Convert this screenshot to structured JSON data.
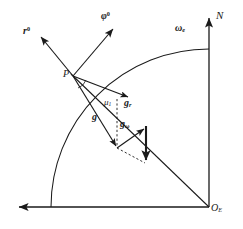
{
  "figure": {
    "name": "earth-gravity-vector-diagram",
    "background": "#ffffff",
    "stroke_color": "#1a1a1a",
    "width": 243,
    "height": 229
  },
  "labels": {
    "r_unit": {
      "base": "r",
      "sup": "0"
    },
    "phi_unit": {
      "base": "φ",
      "sup": "0"
    },
    "omega_e": {
      "base": "ω",
      "sub": "e"
    },
    "north": {
      "base": "N"
    },
    "point_p": {
      "base": "P"
    },
    "origin_e": {
      "base": "O",
      "sub": "E"
    },
    "mu_1": {
      "base": "μ",
      "sub": "1"
    },
    "g_total": {
      "base": "g"
    },
    "g_radial": {
      "base": "g",
      "sub": "r"
    },
    "g_omega": {
      "base": "g",
      "sub": "ω"
    }
  },
  "geometry": {
    "earth_center": {
      "x": 209,
      "y": 207
    },
    "earth_radius": 158,
    "point_p": {
      "x": 73,
      "y": 76
    },
    "axis_vertical": {
      "x": 209,
      "y_top": 14,
      "y_bottom": 207
    },
    "axis_horizontal": {
      "y": 207,
      "x_left": 14,
      "x_right": 209
    },
    "vectors": [
      {
        "name": "r-unit-vector",
        "from": {
          "x": 73,
          "y": 76
        },
        "to": {
          "x": 39,
          "y": 35
        }
      },
      {
        "name": "phi-unit-vector",
        "from": {
          "x": 73,
          "y": 76
        },
        "to": {
          "x": 115,
          "y": 27
        }
      },
      {
        "name": "g-total-vector",
        "from": {
          "x": 73,
          "y": 76
        },
        "to": {
          "x": 117,
          "y": 148
        }
      },
      {
        "name": "g-radial-vector",
        "from": {
          "x": 73,
          "y": 76
        },
        "to": {
          "x": 130,
          "y": 98
        }
      },
      {
        "name": "g-omega-vector",
        "from": {
          "x": 117,
          "y": 148
        },
        "to": {
          "x": 146,
          "y": 127
        }
      },
      {
        "name": "centrifugal-vector",
        "from": {
          "x": 146,
          "y": 126
        },
        "to": {
          "x": 146,
          "y": 164
        }
      },
      {
        "name": "chord-to-origin",
        "from": {
          "x": 73,
          "y": 76
        },
        "to": {
          "x": 209,
          "y": 207
        }
      }
    ],
    "dashed": [
      {
        "name": "dashed-vertical-guide",
        "from": {
          "x": 117,
          "y": 99
        },
        "to": {
          "x": 117,
          "y": 148
        }
      },
      {
        "name": "dashed-diagonal-guide",
        "from": {
          "x": 117,
          "y": 148
        },
        "to": {
          "x": 147,
          "y": 164
        }
      }
    ]
  }
}
